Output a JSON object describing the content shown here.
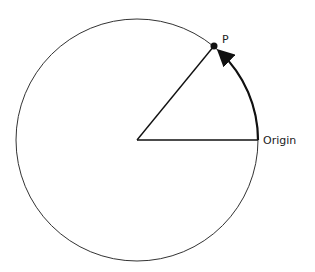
{
  "diagram": {
    "labels": {
      "point": "P",
      "origin": "Origin"
    },
    "colors": {
      "stroke": "#222222",
      "background": "#ffffff"
    },
    "geometry": {
      "center": [
        137,
        140
      ],
      "radius": 121,
      "point_p": [
        214,
        46
      ],
      "origin_point": [
        258,
        140
      ]
    }
  }
}
